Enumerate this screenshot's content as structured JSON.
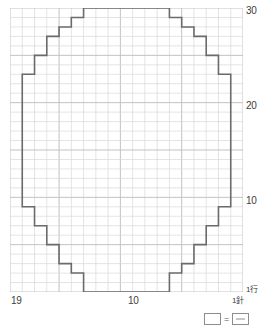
{
  "chart_data": {
    "type": "table",
    "title": "",
    "subtitle": "",
    "xlabel": "",
    "ylabel": "",
    "grid": true,
    "legend_position": "bottom-right",
    "columns": 19,
    "rows": 30,
    "column_direction": "right-to-left",
    "row_direction": "bottom-to-top",
    "heavy_line_every": 5,
    "x_tick_labels": [
      "19",
      "10",
      "1"
    ],
    "y_tick_labels": [
      "30",
      "20",
      "10",
      "1"
    ],
    "stitch_unit_label": "針",
    "row_unit_label": "行",
    "outline_description": "Rounded circular motif outline drawn as a stepped staircase over the 19x19 stitch grid",
    "outline_left_edge_by_row": [
      {
        "row": 1,
        "left_col": 6
      },
      {
        "row": 2,
        "left_col": 6
      },
      {
        "row": 3,
        "left_col": 5
      },
      {
        "row": 4,
        "left_col": 4
      },
      {
        "row": 5,
        "left_col": 4
      },
      {
        "row": 6,
        "left_col": 3
      },
      {
        "row": 7,
        "left_col": 3
      },
      {
        "row": 8,
        "left_col": 2
      },
      {
        "row": 9,
        "left_col": 2
      },
      {
        "row": 10,
        "left_col": 1
      },
      {
        "row": 11,
        "left_col": 1
      },
      {
        "row": 12,
        "left_col": 1
      },
      {
        "row": 13,
        "left_col": 1
      },
      {
        "row": 14,
        "left_col": 1
      },
      {
        "row": 15,
        "left_col": 1
      },
      {
        "row": 16,
        "left_col": 1
      },
      {
        "row": 17,
        "left_col": 1
      },
      {
        "row": 18,
        "left_col": 1
      },
      {
        "row": 19,
        "left_col": 1
      },
      {
        "row": 20,
        "left_col": 1
      },
      {
        "row": 21,
        "left_col": 1
      },
      {
        "row": 22,
        "left_col": 1
      },
      {
        "row": 23,
        "left_col": 1
      },
      {
        "row": 24,
        "left_col": 2
      },
      {
        "row": 25,
        "left_col": 2
      },
      {
        "row": 26,
        "left_col": 3
      },
      {
        "row": 27,
        "left_col": 3
      },
      {
        "row": 28,
        "left_col": 4
      },
      {
        "row": 29,
        "left_col": 5
      },
      {
        "row": 30,
        "left_col": 6
      }
    ],
    "outline_right_edge_by_row": [
      {
        "row": 1,
        "right_col": 14
      },
      {
        "row": 2,
        "right_col": 14
      },
      {
        "row": 3,
        "right_col": 15
      },
      {
        "row": 4,
        "right_col": 16
      },
      {
        "row": 5,
        "right_col": 16
      },
      {
        "row": 6,
        "right_col": 17
      },
      {
        "row": 7,
        "right_col": 17
      },
      {
        "row": 8,
        "right_col": 18
      },
      {
        "row": 9,
        "right_col": 18
      },
      {
        "row": 10,
        "right_col": 19
      },
      {
        "row": 11,
        "right_col": 19
      },
      {
        "row": 12,
        "right_col": 19
      },
      {
        "row": 13,
        "right_col": 19
      },
      {
        "row": 14,
        "right_col": 19
      },
      {
        "row": 15,
        "right_col": 19
      },
      {
        "row": 16,
        "right_col": 19
      },
      {
        "row": 17,
        "right_col": 19
      },
      {
        "row": 18,
        "right_col": 19
      },
      {
        "row": 19,
        "right_col": 19
      },
      {
        "row": 20,
        "right_col": 19
      },
      {
        "row": 21,
        "right_col": 19
      },
      {
        "row": 22,
        "right_col": 19
      },
      {
        "row": 23,
        "right_col": 19
      },
      {
        "row": 24,
        "right_col": 18
      },
      {
        "row": 25,
        "right_col": 18
      },
      {
        "row": 26,
        "right_col": 17
      },
      {
        "row": 27,
        "right_col": 17
      },
      {
        "row": 28,
        "right_col": 16
      },
      {
        "row": 29,
        "right_col": 15
      },
      {
        "row": 30,
        "right_col": 14
      }
    ]
  },
  "axes": {
    "y_top": "30",
    "y_mid_upper": "20",
    "y_mid_lower": "10",
    "y_bottom": "1行",
    "x_left": "19",
    "x_center": "10",
    "x_right": "1針"
  },
  "legend": {
    "equals": "=",
    "empty_symbol_name": "plain-square",
    "dash_symbol_name": "purl-dash-square"
  },
  "colors": {
    "grid_line": "#d8d8d8",
    "grid_line_heavy": "#c2c2c2",
    "outline": "#6b6b6b",
    "text": "#3d3d3d",
    "background": "#ffffff"
  }
}
